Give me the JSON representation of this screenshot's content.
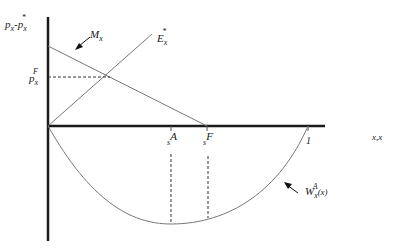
{
  "diagram": {
    "y_axis_label": {
      "base1": "p",
      "sub1": "x",
      "sep": "-",
      "base2": "p",
      "sub2": "x",
      "sup2": "*"
    },
    "x_axis_label": "x,x",
    "curves": {
      "mx": {
        "base": "M",
        "sub": "x"
      },
      "ex": {
        "base": "E",
        "sub": "x",
        "sup": "*"
      },
      "w": {
        "base": "W",
        "sub": "x",
        "sup": "A",
        "arg": "(x)"
      }
    },
    "price_label": {
      "base": "p",
      "sub": "x",
      "sup": "F"
    },
    "ticks": {
      "sA": {
        "base": "s",
        "sup": "A"
      },
      "sF": {
        "base": "s",
        "sup": "F"
      },
      "one": "1"
    },
    "colors": {
      "axis": "#1a1a1a",
      "line": "#666666",
      "dash": "#333333"
    }
  }
}
